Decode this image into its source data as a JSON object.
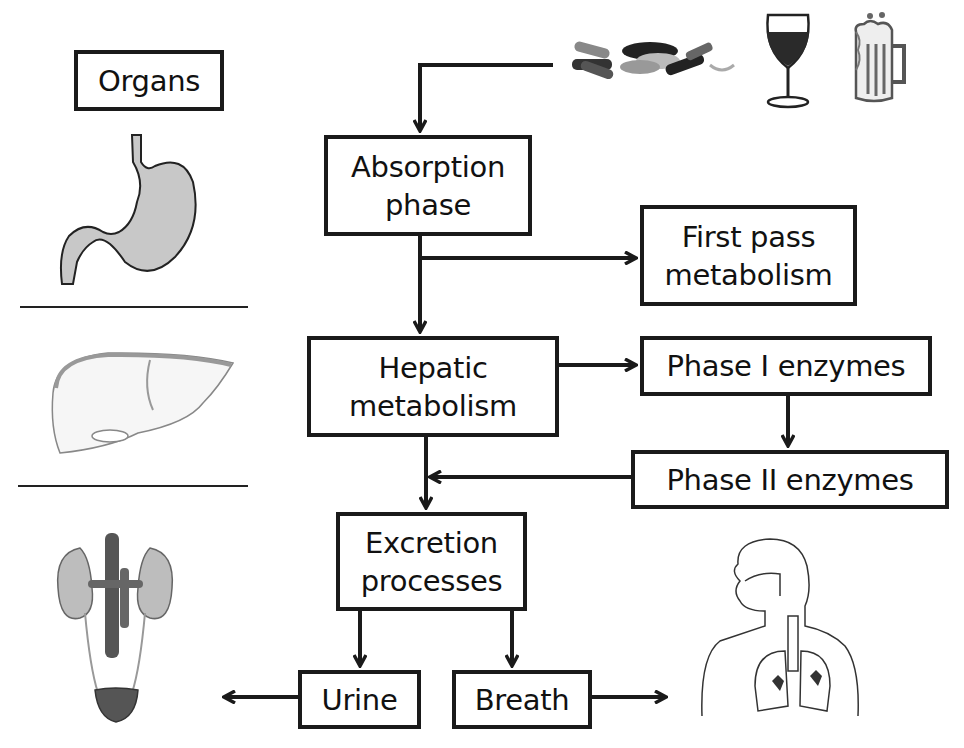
{
  "legend": {
    "organs_label": "Organs"
  },
  "nodes": {
    "absorption": {
      "line1": "Absorption",
      "line2": "phase"
    },
    "first_pass": {
      "line1": "First pass",
      "line2": "metabolism"
    },
    "hepatic": {
      "line1": "Hepatic",
      "line2": "metabolism"
    },
    "phase1": {
      "label": "Phase I enzymes"
    },
    "phase2": {
      "label": "Phase II enzymes"
    },
    "excretion": {
      "line1": "Excretion",
      "line2": "processes"
    },
    "urine": {
      "label": "Urine"
    },
    "breath": {
      "label": "Breath"
    }
  },
  "edges": [
    {
      "from": "intake",
      "to": "absorption"
    },
    {
      "from": "absorption",
      "to": "first_pass"
    },
    {
      "from": "absorption",
      "to": "hepatic"
    },
    {
      "from": "hepatic",
      "to": "phase1"
    },
    {
      "from": "phase1",
      "to": "phase2"
    },
    {
      "from": "phase2",
      "to": "excretion"
    },
    {
      "from": "hepatic",
      "to": "excretion"
    },
    {
      "from": "excretion",
      "to": "urine"
    },
    {
      "from": "excretion",
      "to": "breath"
    },
    {
      "from": "urine",
      "to": "kidneys"
    },
    {
      "from": "breath",
      "to": "lungs"
    }
  ],
  "icons": {
    "intake": [
      "pills-icon",
      "wine-glass-icon",
      "beer-mug-icon"
    ],
    "organs": [
      "stomach-icon",
      "liver-icon",
      "kidneys-icon",
      "respiratory-system-icon"
    ]
  },
  "colors": {
    "stroke": "#1a1a1a",
    "organ_fill": "#c8c8c8",
    "wine": "#2a2a2a"
  }
}
